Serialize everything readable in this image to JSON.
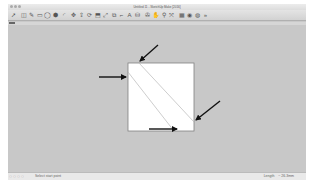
{
  "window": {
    "title": "Untitled 11 - SketchUp Make [2016]"
  },
  "toolbar": {
    "tools": [
      {
        "name": "select-tool-icon",
        "glyph": "➚"
      },
      {
        "name": "eraser-tool-icon",
        "glyph": "◫"
      },
      {
        "name": "pencil-line-tool-icon",
        "glyph": "✎"
      },
      {
        "name": "rectangle-tool-icon",
        "glyph": "▭"
      },
      {
        "name": "circle-tool-icon",
        "glyph": "◯"
      },
      {
        "name": "polygon-tool-icon",
        "glyph": "⬢"
      },
      {
        "name": "arc-tool-icon",
        "glyph": "◜"
      },
      {
        "name": "move-tool-icon",
        "glyph": "✥"
      },
      {
        "name": "push-pull-tool-icon",
        "glyph": "⇪"
      },
      {
        "name": "rotate-tool-icon",
        "glyph": "⟳"
      },
      {
        "name": "follow-me-tool-icon",
        "glyph": "⬒"
      },
      {
        "name": "scale-tool-icon",
        "glyph": "⤢"
      },
      {
        "name": "offset-tool-icon",
        "glyph": "⧉"
      },
      {
        "name": "tape-measure-tool-icon",
        "glyph": "⌐"
      },
      {
        "name": "text-tool-icon",
        "glyph": "A"
      },
      {
        "name": "paint-bucket-tool-icon",
        "glyph": "⛁"
      },
      {
        "name": "orbit-tool-icon",
        "glyph": "✇"
      },
      {
        "name": "pan-tool-icon",
        "glyph": "✋"
      },
      {
        "name": "zoom-tool-icon",
        "glyph": "⚲"
      },
      {
        "name": "zoom-extents-tool-icon",
        "glyph": "⤧"
      },
      {
        "name": "warehouse-icon",
        "glyph": "▦"
      },
      {
        "name": "extension-warehouse-icon",
        "glyph": "◉"
      },
      {
        "name": "layout-icon",
        "glyph": "◍"
      },
      {
        "name": "more-tools-icon",
        "glyph": "»"
      }
    ]
  },
  "status": {
    "hint": "Select start point",
    "measurement_label": "Length",
    "measurement_value": "~ 26.3mm"
  },
  "drawing": {
    "square": {
      "x": 120,
      "y": 59,
      "w": 66,
      "h": 68,
      "fill": "#ffffff",
      "stroke": "#808080"
    },
    "diagonal_lines": [
      {
        "x1": 120,
        "y1": 68,
        "x2": 166,
        "y2": 127
      },
      {
        "x1": 131,
        "y1": 59,
        "x2": 186,
        "y2": 118
      }
    ],
    "arrows": [
      {
        "id": "left",
        "x1": 91,
        "y1": 73,
        "x2": 118,
        "y2": 73
      },
      {
        "id": "top",
        "x1": 150,
        "y1": 41,
        "x2": 132,
        "y2": 57
      },
      {
        "id": "right",
        "x1": 212,
        "y1": 97,
        "x2": 188,
        "y2": 116
      },
      {
        "id": "bottom",
        "x1": 141,
        "y1": 125,
        "x2": 169,
        "y2": 125
      }
    ],
    "arrow_color": "#111111"
  }
}
